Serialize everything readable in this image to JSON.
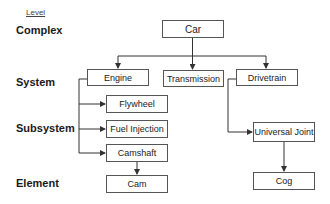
{
  "legend": {
    "header": "Level"
  },
  "levels": [
    {
      "label": "Complex"
    },
    {
      "label": "System"
    },
    {
      "label": "Subsystem"
    },
    {
      "label": "Element"
    }
  ],
  "nodes": {
    "car": "Car",
    "engine": "Engine",
    "transmission": "Transmission",
    "drivetrain": "Drivetrain",
    "flywheel": "Flywheel",
    "fuel_injection": "Fuel Injection",
    "camshaft": "Camshaft",
    "universal_joint": "Universal Joint",
    "cam": "Cam",
    "cog": "Cog"
  },
  "edges": [
    [
      "car",
      "engine"
    ],
    [
      "car",
      "transmission"
    ],
    [
      "car",
      "drivetrain"
    ],
    [
      "engine",
      "flywheel"
    ],
    [
      "engine",
      "fuel_injection"
    ],
    [
      "engine",
      "camshaft"
    ],
    [
      "camshaft",
      "cam"
    ],
    [
      "drivetrain",
      "universal_joint"
    ],
    [
      "universal_joint",
      "cog"
    ]
  ],
  "colors": {
    "line": "#333333",
    "box_border": "#555555"
  }
}
